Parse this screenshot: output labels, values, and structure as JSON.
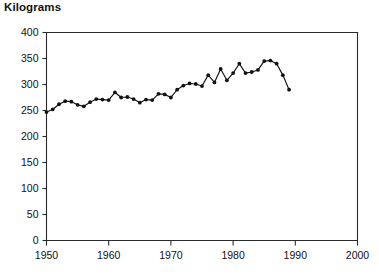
{
  "chart_data": {
    "type": "line",
    "title": "Kilograms",
    "subtitle": "",
    "xlabel": "",
    "ylabel": "Kilograms",
    "xlim": [
      1950,
      2000
    ],
    "ylim": [
      0,
      400
    ],
    "xticks": [
      1950,
      1960,
      1970,
      1980,
      1990,
      2000
    ],
    "yticks": [
      0,
      50,
      100,
      150,
      200,
      250,
      300,
      350,
      400
    ],
    "xtick_labels": [
      "1950",
      "1960",
      "1970",
      "1980",
      "1990",
      "2000"
    ],
    "ytick_labels": [
      "0",
      "50",
      "100",
      "150",
      "200",
      "250",
      "300",
      "350",
      "400"
    ],
    "grid": false,
    "legend": false,
    "legend_position": "none",
    "marker": "filled-circle",
    "line_color": "#111111",
    "marker_color": "#111111",
    "axis_color": "#2a2a2a",
    "background_color": "#ffffff",
    "series": [
      {
        "name": "Kilograms",
        "x": [
          1950,
          1951,
          1952,
          1953,
          1954,
          1955,
          1956,
          1957,
          1958,
          1959,
          1960,
          1961,
          1962,
          1963,
          1964,
          1965,
          1966,
          1967,
          1968,
          1969,
          1970,
          1971,
          1972,
          1973,
          1974,
          1975,
          1976,
          1977,
          1978,
          1979,
          1980,
          1981,
          1982,
          1983,
          1984,
          1985,
          1986,
          1987,
          1988,
          1989
        ],
        "values": [
          247,
          252,
          262,
          268,
          267,
          261,
          258,
          266,
          272,
          271,
          270,
          285,
          275,
          276,
          272,
          265,
          271,
          270,
          282,
          281,
          275,
          290,
          298,
          302,
          301,
          297,
          318,
          304,
          330,
          308,
          322,
          340,
          322,
          324,
          328,
          345,
          346,
          340,
          318,
          290
        ]
      }
    ]
  }
}
